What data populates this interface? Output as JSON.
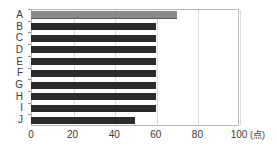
{
  "chart_data": {
    "type": "bar",
    "orientation": "horizontal",
    "title": "",
    "xlabel": "",
    "ylabel": "",
    "unit_label": "(点)",
    "categories": [
      "A",
      "B",
      "C",
      "D",
      "E",
      "F",
      "G",
      "H",
      "I",
      "J"
    ],
    "values": [
      70,
      60,
      60,
      60,
      60,
      60,
      60,
      60,
      60,
      50
    ],
    "xlim": [
      0,
      100
    ],
    "xticks": [
      0,
      20,
      40,
      60,
      80,
      100
    ],
    "xtick_labels": [
      "0",
      "20",
      "40",
      "60",
      "80",
      "100"
    ],
    "grid": true,
    "grid_axis": "x",
    "legend": false,
    "series": [
      {
        "name": "score",
        "values": [
          70,
          60,
          60,
          60,
          60,
          60,
          60,
          60,
          60,
          50
        ]
      }
    ],
    "highlight_category": "A",
    "colors": {
      "bar": "#2b2b2b",
      "bar_highlight": "#8a8a8a",
      "gridline": "#dcdcdc",
      "frame": "#b8b8b8",
      "text": "#3a3a3a",
      "background": "#ffffff"
    }
  }
}
